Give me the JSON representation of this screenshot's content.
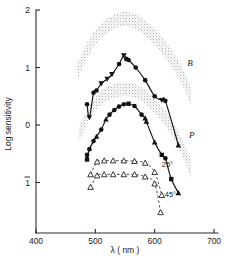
{
  "chart_data": {
    "type": "line",
    "title": "",
    "xlabel": "λ ( nm )",
    "ylabel": "Log sensitivity",
    "xlim": [
      400,
      700
    ],
    "ylim": [
      -1.6,
      2.0
    ],
    "xticks": [
      400,
      500,
      600,
      700
    ],
    "xtick_labels": [
      "400",
      "500",
      "600",
      "700"
    ],
    "yticks": [
      2,
      1,
      0,
      -1
    ],
    "ytick_labels": [
      "2",
      "1",
      "0",
      "1"
    ],
    "ytick_overbar": [
      false,
      false,
      false,
      true
    ],
    "grid": false,
    "legend_position": "inline-annotations",
    "annotations": [
      {
        "text": "B",
        "x": 655,
        "y": 1.03,
        "style": "italic",
        "role": "curve-label-upper"
      },
      {
        "text": "P",
        "x": 658,
        "y": -0.22,
        "style": "italic",
        "role": "curve-label-lower"
      },
      {
        "text": "25°",
        "x": 612,
        "y": -0.73,
        "style": "normal",
        "role": "dashed-curve-label-upper"
      },
      {
        "text": "45°",
        "x": 617,
        "y": -1.26,
        "style": "normal",
        "role": "dashed-curve-label-lower"
      }
    ],
    "series": [
      {
        "name": "B",
        "label": "B",
        "curve_style": "solid",
        "marker": "mixed-filled",
        "x": [
          486,
          490,
          497,
          502,
          510,
          520,
          528,
          540,
          548,
          552,
          556,
          568,
          584,
          600,
          612,
          618,
          640
        ],
        "y": [
          0.36,
          0.13,
          0.56,
          0.6,
          0.72,
          0.8,
          0.88,
          1.06,
          1.21,
          1.15,
          1.13,
          1.0,
          0.78,
          0.5,
          0.43,
          0.42,
          -0.35
        ],
        "markers": [
          "circle",
          "triangle-down",
          "circle",
          "circle",
          "triangle-down",
          "triangle-down",
          "triangle-down",
          "circle",
          "triangle-down",
          "circle",
          "circle",
          "circle",
          "circle",
          "circle",
          "triangle-down",
          "circle",
          "triangle-up"
        ]
      },
      {
        "name": "P",
        "label": "P",
        "curve_style": "solid",
        "marker": "mixed-filled",
        "x": [
          486,
          486,
          490,
          497,
          502,
          510,
          518,
          524,
          532,
          540,
          548,
          556,
          566,
          578,
          584,
          586,
          600,
          612,
          618,
          628,
          640
        ],
        "y": [
          -0.52,
          -0.6,
          -0.42,
          -0.28,
          -0.2,
          -0.08,
          0.1,
          0.18,
          0.26,
          0.32,
          0.36,
          0.37,
          0.33,
          0.18,
          0.12,
          0.06,
          -0.3,
          -0.52,
          -0.58,
          -0.94,
          -1.18
        ],
        "markers": [
          "circle",
          "square",
          "circle",
          "circle",
          "triangle-up",
          "circle",
          "triangle-up",
          "circle",
          "circle",
          "circle",
          "circle",
          "square",
          "circle",
          "circle",
          "triangle-up",
          "triangle-up",
          "triangle-up",
          "square",
          "circle",
          "square",
          "triangle-up"
        ]
      },
      {
        "name": "25°",
        "label": "25°",
        "curve_style": "dashed",
        "marker": "triangle-open",
        "x": [
          492,
          503,
          515,
          530,
          548,
          566,
          584,
          600,
          612
        ],
        "y": [
          -0.86,
          -0.64,
          -0.62,
          -0.62,
          -0.62,
          -0.63,
          -0.66,
          -0.82,
          -1.22
        ]
      },
      {
        "name": "45°",
        "label": "45°",
        "curve_style": "dashed",
        "marker": "triangle-open",
        "x": [
          492,
          503,
          515,
          530,
          548,
          566,
          584,
          600,
          610
        ],
        "y": [
          -1.08,
          -0.88,
          -0.86,
          -0.86,
          -0.86,
          -0.86,
          -0.9,
          -1.02,
          -1.52
        ]
      }
    ],
    "bands": [
      {
        "name": "B-band",
        "description": "stippled confidence band above the B curve",
        "upper_x": [
          470,
          495,
          520,
          545,
          570,
          595,
          620,
          645,
          662
        ],
        "upper_y": [
          1.08,
          1.58,
          1.85,
          1.96,
          1.92,
          1.72,
          1.44,
          1.02,
          0.62
        ],
        "lower_x": [
          470,
          495,
          520,
          545,
          570,
          595,
          620,
          645,
          662
        ],
        "lower_y": [
          0.8,
          1.32,
          1.6,
          1.72,
          1.66,
          1.44,
          1.14,
          0.72,
          0.34
        ]
      },
      {
        "name": "P-band",
        "description": "stippled confidence band above the P curve",
        "upper_x": [
          472,
          495,
          520,
          545,
          570,
          595,
          620,
          645,
          662
        ],
        "upper_y": [
          -0.05,
          0.42,
          0.66,
          0.74,
          0.7,
          0.5,
          0.22,
          -0.22,
          -0.62
        ],
        "lower_x": [
          472,
          495,
          520,
          545,
          570,
          595,
          620,
          645,
          662
        ],
        "lower_y": [
          -0.3,
          0.18,
          0.42,
          0.5,
          0.46,
          0.26,
          -0.04,
          -0.5,
          -0.92
        ]
      }
    ]
  },
  "colors": {
    "axis": "#2b2b2b",
    "curve": "#111111",
    "dashed_curve": "#333333",
    "marker_fill": "#111111",
    "marker_open_fill": "#ffffff",
    "band_stipple": "#b9b9b9",
    "background": "#ffffff"
  }
}
